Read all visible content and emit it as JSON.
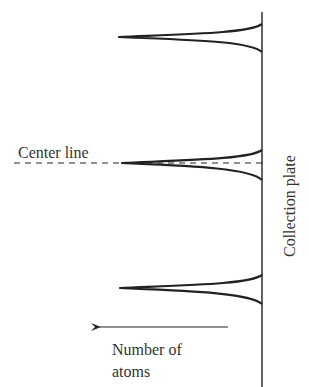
{
  "diagram": {
    "center_line_label": "Center line",
    "collection_plate_label": "Collection plate",
    "axis_label_line1": "Number of",
    "axis_label_line2": "atoms",
    "colors": {
      "stroke": "#222222",
      "text": "#333333",
      "background": "#ffffff"
    },
    "peaks": [
      {
        "name": "top-peak",
        "tip_y": 37
      },
      {
        "name": "center-peak",
        "tip_y": 163
      },
      {
        "name": "bottom-peak",
        "tip_y": 288
      }
    ]
  }
}
